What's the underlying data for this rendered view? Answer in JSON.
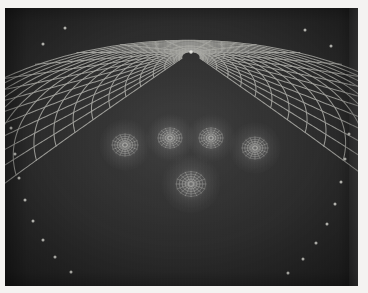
{
  "figure": {
    "panel": {
      "background_color": "#2b2b2b",
      "line_color": "#b9b9b4",
      "node_color": "#d8d8d2",
      "page_color": "#f4f3f1",
      "width": 353,
      "height": 278
    }
  },
  "chart_data": {
    "type": "diagram",
    "subtitle": "",
    "xlabel": "",
    "ylabel": "",
    "grid": true,
    "legend": "none",
    "mesh": {
      "radial_line_count": 25,
      "arc_line_count": 17,
      "orthogonal": true,
      "focus_point": {
        "x": 186,
        "y": 44
      },
      "outer_extent": {
        "x": 184,
        "y": 300,
        "rx": 250,
        "ry": 255
      }
    },
    "singular_points": [
      {
        "name": "left-satellite",
        "x": 120,
        "y": 137,
        "radius": 14,
        "type": "vortex"
      },
      {
        "name": "centre-left",
        "x": 165,
        "y": 130,
        "radius": 13,
        "type": "vortex"
      },
      {
        "name": "centre-right",
        "x": 206,
        "y": 130,
        "radius": 13,
        "type": "vortex"
      },
      {
        "name": "right-satellite",
        "x": 250,
        "y": 140,
        "radius": 14,
        "type": "vortex"
      },
      {
        "name": "lower-centre",
        "x": 186,
        "y": 176,
        "radius": 16,
        "type": "vortex"
      }
    ],
    "boundary_nodes_left": [
      {
        "x": 6,
        "y": 120
      },
      {
        "x": 10,
        "y": 146
      },
      {
        "x": 14,
        "y": 170
      },
      {
        "x": 20,
        "y": 192
      },
      {
        "x": 28,
        "y": 213
      },
      {
        "x": 38,
        "y": 232
      },
      {
        "x": 50,
        "y": 249
      },
      {
        "x": 66,
        "y": 264
      }
    ],
    "boundary_nodes_right": [
      {
        "x": 344,
        "y": 126
      },
      {
        "x": 340,
        "y": 151
      },
      {
        "x": 336,
        "y": 174
      },
      {
        "x": 330,
        "y": 196
      },
      {
        "x": 322,
        "y": 216
      },
      {
        "x": 311,
        "y": 235
      },
      {
        "x": 298,
        "y": 251
      },
      {
        "x": 283,
        "y": 265
      }
    ],
    "boundary_nodes_top": [
      {
        "x": 38,
        "y": 36
      },
      {
        "x": 60,
        "y": 20
      },
      {
        "x": 300,
        "y": 22
      },
      {
        "x": 326,
        "y": 38
      }
    ]
  }
}
